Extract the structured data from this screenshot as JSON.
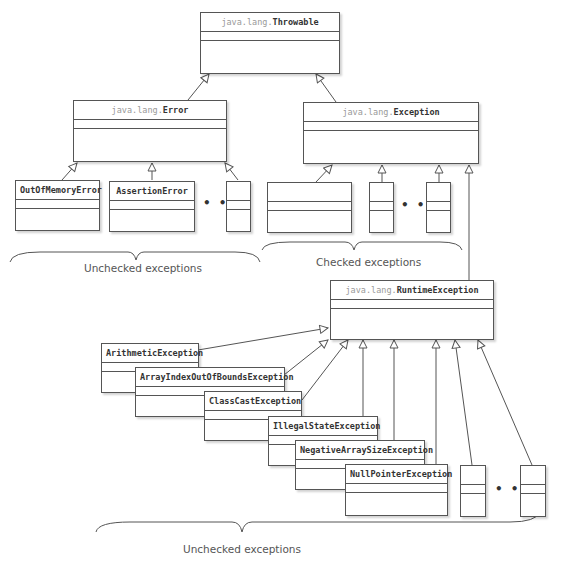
{
  "diagram": {
    "classes": {
      "throwable": {
        "pkg": "java.lang.",
        "name": "Throwable"
      },
      "error": {
        "pkg": "java.lang.",
        "name": "Error"
      },
      "exception": {
        "pkg": "java.lang.",
        "name": "Exception"
      },
      "runtime": {
        "pkg": "java.lang.",
        "name": "RuntimeException"
      },
      "oom": {
        "name": "OutOfMemoryError"
      },
      "assertion": {
        "name": "AssertionError"
      },
      "arith": {
        "name": "ArithmeticException"
      },
      "aioobe": {
        "name": "ArrayIndexOutOfBoundsException"
      },
      "cce": {
        "name": "ClassCastException"
      },
      "ise": {
        "name": "IllegalStateException"
      },
      "nase": {
        "name": "NegativeArraySizeException"
      },
      "npe": {
        "name": "NullPointerException"
      }
    },
    "labels": {
      "unchecked_error": "Unchecked exceptions",
      "checked": "Checked exceptions",
      "unchecked_runtime": "Unchecked exceptions"
    },
    "ellipsis": "• • •"
  }
}
